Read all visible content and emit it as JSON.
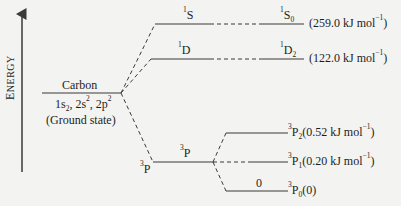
{
  "axis": {
    "label_first": "E",
    "label_rest": "NERGY"
  },
  "ground": {
    "name": "Carbon",
    "config_a": "1s",
    "config_a_sub": "2",
    "config_sep1": ", 2s",
    "config_b_sup": "2",
    "config_sep2": ", 2p",
    "config_c_sup": "2",
    "state": "(Ground state)"
  },
  "terms": {
    "S": {
      "mult": "1",
      "sym": "S"
    },
    "D": {
      "mult": "1",
      "sym": "D"
    },
    "P": {
      "mult": "3",
      "sym": "P"
    },
    "P_low": {
      "mult": "3",
      "sym": "P"
    }
  },
  "levels": {
    "S0": {
      "mult": "1",
      "sym": "S",
      "j": "0",
      "energy": "(259.0 kJ mol",
      "exp": "−1",
      "close": ")"
    },
    "D2": {
      "mult": "1",
      "sym": "D",
      "j": "2",
      "energy": "(122.0 kJ mol",
      "exp": "−1",
      "close": ")"
    },
    "P2": {
      "mult": "3",
      "sym": "P",
      "j": "2",
      "energy": "(0.52 kJ mol",
      "exp": "−1",
      "close": ")"
    },
    "P1": {
      "mult": "3",
      "sym": "P",
      "j": "1",
      "energy": "(0.20 kJ mol",
      "exp": "−1",
      "close": ")"
    },
    "P0": {
      "mult": "3",
      "sym": "P",
      "j": "0",
      "energy": "(0)"
    }
  },
  "zero_label": "0",
  "colors": {
    "line": "#3a3a3a",
    "text": "#1e1e1e",
    "background": "#f3f3f1"
  }
}
